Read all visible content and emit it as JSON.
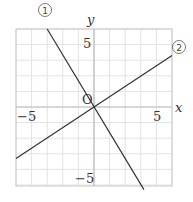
{
  "chart_data": {
    "type": "line",
    "title": "",
    "xlabel": "x",
    "ylabel": "y",
    "origin_label": "O",
    "xlim": [
      -5,
      5
    ],
    "ylim": [
      -5,
      5
    ],
    "grid": true,
    "x_ticks": [
      {
        "value": -5,
        "label": "−5"
      },
      {
        "value": 5,
        "label": "5"
      }
    ],
    "y_ticks": [
      {
        "value": 5,
        "label": "5"
      },
      {
        "value": -5,
        "label": "−5"
      }
    ],
    "series": [
      {
        "name": "①",
        "label": "①",
        "slope": -1.667,
        "intercept": 0,
        "points": [
          [
            -3,
            5
          ],
          [
            3.2,
            -5.3
          ]
        ]
      },
      {
        "name": "②",
        "label": "②",
        "slope": 0.667,
        "intercept": 0,
        "points": [
          [
            -5,
            -3.3
          ],
          [
            5,
            3.3
          ]
        ]
      }
    ]
  },
  "colors": {
    "grid": "#e3e3e3",
    "axis": "#bdbdbd",
    "line": "#333333",
    "text": "#333333"
  }
}
